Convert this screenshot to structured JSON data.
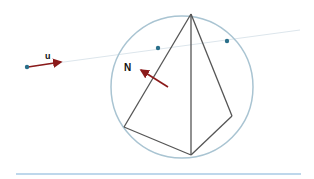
{
  "labels": {
    "u": "u",
    "N": "N"
  },
  "colors": {
    "circle": "#a9c4d2",
    "edges": "#555555",
    "ray": "#dde6ec",
    "vector": "#8b1a1a",
    "dot": "#2a6f8a",
    "baseline": "#7fb0d8"
  },
  "circle": {
    "cx": 182,
    "cy": 87,
    "r": 71
  },
  "vertices": {
    "apex": [
      191,
      14
    ],
    "left": [
      124,
      127
    ],
    "bottom": [
      191,
      155
    ],
    "right": [
      232,
      116
    ]
  },
  "ray": {
    "start": [
      27,
      67
    ],
    "end": [
      300,
      30
    ]
  },
  "points": [
    [
      27,
      67
    ],
    [
      158,
      48
    ],
    [
      227,
      41
    ]
  ]
}
